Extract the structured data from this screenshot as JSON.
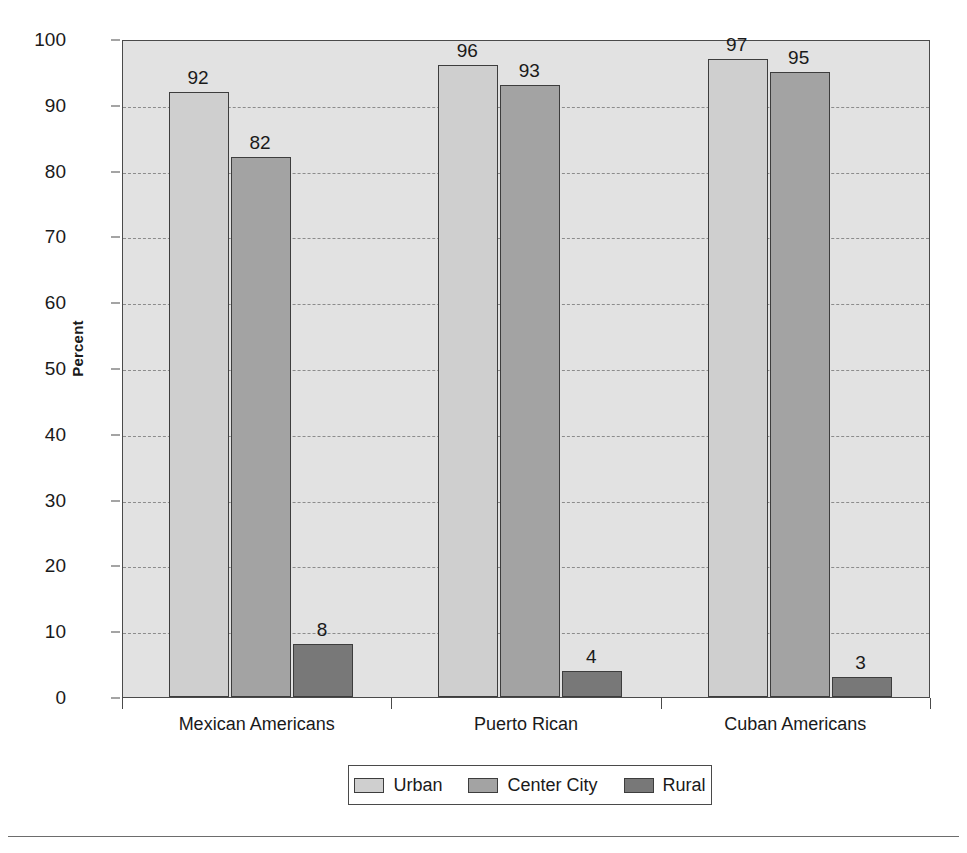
{
  "chart_data": {
    "type": "bar",
    "title": "",
    "xlabel": "",
    "ylabel": "Percent",
    "ylim": [
      0,
      100
    ],
    "yticks": [
      0,
      10,
      20,
      30,
      40,
      50,
      60,
      70,
      80,
      90,
      100
    ],
    "ytick_labels": [
      "0",
      "10",
      "20",
      "30",
      "40",
      "50",
      "60",
      "70",
      "80",
      "90",
      "100"
    ],
    "grid": "horizontal-dashed",
    "legend_position": "bottom",
    "categories": [
      "Mexican Americans",
      "Puerto Rican",
      "Cuban Americans"
    ],
    "series": [
      {
        "name": "Urban",
        "color": "#cfcfcf",
        "values": [
          92,
          96,
          97
        ],
        "labels": [
          "92",
          "96",
          "97"
        ]
      },
      {
        "name": "Center City",
        "color": "#a3a3a3",
        "values": [
          82,
          93,
          95
        ],
        "labels": [
          "82",
          "93",
          "95"
        ]
      },
      {
        "name": "Rural",
        "color": "#787878",
        "values": [
          8,
          4,
          3
        ],
        "labels": [
          "8",
          "4",
          "3"
        ]
      }
    ]
  },
  "axis": {
    "y_title": "Percent",
    "y_ticks": [
      "100",
      "90",
      "80",
      "70",
      "60",
      "50",
      "40",
      "30",
      "20",
      "10",
      "0"
    ],
    "x_categories": [
      "Mexican Americans",
      "Puerto Rican",
      "Cuban Americans"
    ]
  },
  "legend": {
    "items": [
      {
        "label": "Urban",
        "color": "#cfcfcf"
      },
      {
        "label": "Center City",
        "color": "#a3a3a3"
      },
      {
        "label": "Rural",
        "color": "#787878"
      }
    ]
  },
  "colors": {
    "plot_background": "#e2e2e2",
    "axis": "#4a4a4a",
    "gridline": "#8c8c8c",
    "bar_border": "#3d3d3d",
    "text": "#1a1a1a",
    "page_background": "#ffffff"
  }
}
